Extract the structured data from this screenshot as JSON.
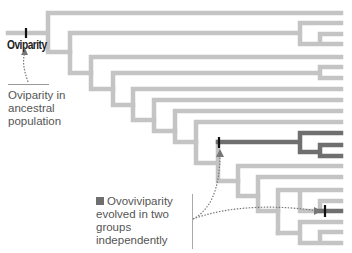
{
  "labels": {
    "root_trait": "Oviparity",
    "ancestral_note": "Oviparity in ancestral population",
    "derived_note": "Ovoviviparity evolved in two groups independently"
  },
  "colors": {
    "branch_gray": "#c4c4c4",
    "branch_dark": "#6f6f6f",
    "tick": "#111111",
    "arrow": "#777777"
  },
  "tree": {
    "stroke_width": 4.5,
    "gray_paths": [
      "M8 33 H48 M48 13 V52 M48 13 H341 M48 52 H70",
      "M70 33 V73 M70 33 H300 M300 23 V44 M300 23 H341 M300 44 H320 M320 34 V44 M320 34 H341 M320 44 H341 M70 73 H91",
      "M91 57 V89 M91 57 H341 M91 89 H113",
      "M113 73 V105 M113 73 H320 M320 67 V78 M320 67 H341 M320 78 H341 M113 105 H133",
      "M133 89 V120 M133 89 H341 M133 120 H154",
      "M154 100 V131 M154 100 H341 M154 131 H175",
      "M175 111 V142 M175 111 H341 M175 142 H196",
      "M196 122 V163 M196 122 H341 M196 163 H218",
      "M218 142 V181 M218 181 H238",
      "M238 166 V196 M238 166 H341 M238 196 H258",
      "M258 177 V211 M258 177 H341 M258 211 H278",
      "M278 190 V233 M278 190 H300 M300 190 V211 M300 190 H341 M300 211 H320 M320 201 V211 M320 201 H341",
      "M278 233 H300 M300 222 V243 M300 222 H341 M300 243 H320 M320 232 V243 M320 232 H341 M320 243 H341"
    ],
    "dark_paths": [
      "M218 142 H300 M300 133 V152 M300 133 H341 M300 152 H320 M320 145 V156 M320 145 H341 M320 156 H341",
      "M320 211 H341"
    ],
    "ticks": [
      {
        "x": 26,
        "y1": 28,
        "y2": 38
      },
      {
        "x": 219,
        "y1": 137,
        "y2": 148
      },
      {
        "x": 325,
        "y1": 205,
        "y2": 217
      }
    ],
    "arrows": [
      {
        "d": "M28 82 C24 70 22 62 25 52",
        "head": "25,48 21,55 28,55"
      },
      {
        "d": "M193 219 C210 210 220 190 220 153",
        "head": "220,149 216,157 224,157"
      },
      {
        "d": "M193 219 C230 205 280 205 318 211",
        "head": "322,211 314,207 314,215"
      }
    ]
  }
}
